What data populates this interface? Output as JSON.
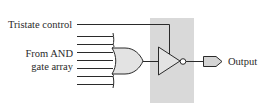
{
  "diagram": {
    "labels": {
      "tristate_control": "Tristate control",
      "from_and_line1": "From AND",
      "from_and_line2": "gate array",
      "output": "Output"
    },
    "components": [
      "or-gate",
      "tristate-inverting-buffer",
      "output-pin"
    ],
    "input_line_count": 7,
    "colors": {
      "highlight_box": "#d9d9d9",
      "gate_fill": "#e3e3e3",
      "stroke": "#2a2a2a"
    }
  }
}
